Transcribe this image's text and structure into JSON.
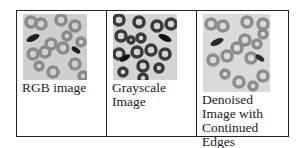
{
  "table": {
    "cells": [
      {
        "caption": "RGB image",
        "image": "rgb-blood-cell-image",
        "bg": "#cfcfcf",
        "ring": "#8a8a8a",
        "dark": "#1e1e1e"
      },
      {
        "caption": "Grayscale Image",
        "image": "grayscale-blood-cell-image",
        "bg": "#d4d4d4",
        "ring": "#3a3a3a",
        "dark": "#111111"
      },
      {
        "caption": "Denoised Image with Continued Edges",
        "image": "denoised-blood-cell-image",
        "bg": "#dadada",
        "ring": "#8c8c8c",
        "dark": "#2a2a2a"
      }
    ]
  }
}
